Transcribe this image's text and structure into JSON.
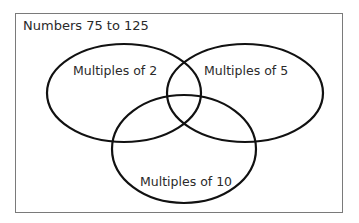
{
  "diagram": {
    "type": "venn",
    "title": "Numbers 75 to 125",
    "sets": [
      {
        "id": "multiples-of-2",
        "label": "Multiples of 2"
      },
      {
        "id": "multiples-of-5",
        "label": "Multiples of 5"
      },
      {
        "id": "multiples-of-10",
        "label": "Multiples of 10"
      }
    ],
    "colors": {
      "outline": "#111111",
      "frame": "#7a7a7a",
      "text": "#2a2a2a",
      "background": "#ffffff"
    }
  }
}
